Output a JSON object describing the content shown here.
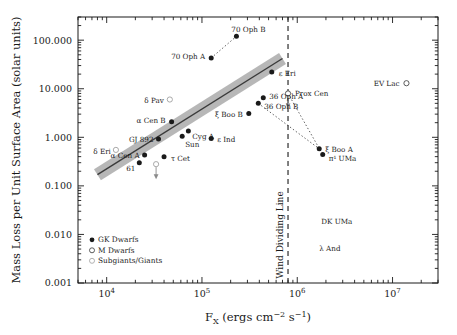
{
  "figure": {
    "title": "",
    "axis": {
      "xlabel_parts": {
        "f": "F",
        "sub_x": "X",
        "rest": " (ergs cm",
        "sup1": "−2",
        "mid": " s",
        "sup2": "−1",
        "close": ")"
      },
      "xlabel_plain": "Fx (ergs cm-2 s-1)",
      "ylabel": "Mass Loss per Unit Surface Area (solar units)",
      "x_ticks": [
        "10⁴",
        "10⁵",
        "10⁶",
        "10⁷"
      ],
      "x_tick_values": [
        10000,
        100000,
        1000000,
        10000000
      ],
      "y_ticks": [
        "100.000",
        "10.000",
        "1.000",
        "0.100",
        "0.010",
        "0.001"
      ],
      "y_tick_values": [
        100,
        10,
        1,
        0.1,
        0.01,
        0.001
      ],
      "xlim": [
        5000,
        30000000
      ],
      "ylim": [
        0.001,
        300
      ],
      "xscale": "log",
      "yscale": "log",
      "grid": false
    },
    "legend": {
      "position": "lower-left-inside",
      "items": [
        {
          "label": "GK Dwarfs",
          "marker": "filled-circle",
          "color": "#1a1a1a"
        },
        {
          "label": "M Dwarfs",
          "marker": "open-circle",
          "color": "#1a1a1a"
        },
        {
          "label": "Subgiants/Giants",
          "marker": "open-circle-light",
          "color": "#9a9a9a"
        }
      ]
    },
    "annotations": [
      {
        "name": "wind-dividing-line",
        "text": "Wind Dividing Line",
        "orientation": "vertical",
        "x_value": 800000,
        "style": "dashed"
      }
    ]
  },
  "chart_data": {
    "type": "scatter",
    "title": "",
    "xlabel": "Fx (ergs cm^-2 s^-1)",
    "ylabel": "Mass Loss per Unit Surface Area (solar units)",
    "xscale": "log",
    "yscale": "log",
    "xlim": [
      5000,
      30000000
    ],
    "ylim": [
      0.001,
      300
    ],
    "xticks": [
      10000,
      100000,
      1000000,
      10000000
    ],
    "yticks": [
      100,
      10,
      1,
      0.1,
      0.01,
      0.001
    ],
    "grid": false,
    "legend": [
      "GK Dwarfs",
      "M Dwarfs",
      "Subgiants/Giants"
    ],
    "fit": {
      "description": "power-law best fit with shaded uncertainty band",
      "x_start": 8000,
      "y_start": 0.17,
      "x_end": 700000,
      "y_end": 42,
      "band_color": "#8a8a8a",
      "line_color": "#3a3a3a"
    },
    "series": [
      {
        "name": "GK Dwarfs",
        "marker": "filled-circle",
        "points": [
          {
            "label": "70 Oph B",
            "x": 230000,
            "y": 120,
            "lx": 12,
            "ly": -6,
            "anchor": "middle"
          },
          {
            "label": "70 Oph A",
            "x": 125000,
            "y": 43,
            "lx": -6,
            "ly": -1,
            "anchor": "end"
          },
          {
            "label": "ε Eri",
            "x": 540000,
            "y": 22,
            "lx": 7,
            "ly": 2,
            "anchor": "start"
          },
          {
            "label": "36 Oph A",
            "x": 440000,
            "y": 6.5,
            "lx": 6,
            "ly": -1,
            "anchor": "start"
          },
          {
            "label": "36 Oph B",
            "x": 390000,
            "y": 5.0,
            "lx": 6,
            "ly": 4,
            "anchor": "start"
          },
          {
            "label": "ξ Boo B",
            "x": 310000,
            "y": 3.1,
            "lx": -6,
            "ly": 2,
            "anchor": "end"
          },
          {
            "label": "α Cen B",
            "x": 48000,
            "y": 2.1,
            "lx": -6,
            "ly": -1,
            "anchor": "end"
          },
          {
            "label": "Cyg A",
            "x": 72000,
            "y": 1.35,
            "lx": 4,
            "ly": 6,
            "anchor": "start"
          },
          {
            "label": "Sun",
            "x": 62000,
            "y": 1.05,
            "lx": 3,
            "ly": 9,
            "anchor": "start"
          },
          {
            "label": "GJ 892",
            "x": 35000,
            "y": 0.92,
            "lx": -5,
            "ly": 1,
            "anchor": "end"
          },
          {
            "label": "ε Ind",
            "x": 125000,
            "y": 0.95,
            "lx": 6,
            "ly": 2,
            "anchor": "start"
          },
          {
            "label": "α Cen A",
            "x": 25000,
            "y": 0.43,
            "lx": -5,
            "ly": 1,
            "anchor": "end"
          },
          {
            "label": "τ Cet",
            "x": 40000,
            "y": 0.4,
            "lx": 7,
            "ly": 2,
            "anchor": "start"
          },
          {
            "label": "61",
            "x": 22000,
            "y": 0.3,
            "lx": -4,
            "ly": 6,
            "anchor": "end"
          },
          {
            "label": "ξ Boo A",
            "x": 1700000,
            "y": 0.58,
            "lx": 6,
            "ly": 1,
            "anchor": "start"
          },
          {
            "label": "π¹ UMa",
            "x": 1850000,
            "y": 0.44,
            "lx": 6,
            "ly": 4,
            "anchor": "start"
          }
        ]
      },
      {
        "name": "M Dwarfs",
        "marker": "open-circle",
        "points": [
          {
            "label": "Prox Cen",
            "x": 800000,
            "y": 8.0,
            "lx": 7,
            "ly": 1,
            "anchor": "start",
            "uplim": true
          },
          {
            "label": "EV Lac",
            "x": 14000000,
            "y": 13.0,
            "lx": -7,
            "ly": 1,
            "anchor": "end"
          }
        ]
      },
      {
        "name": "Subgiants/Giants",
        "marker": "open-circle-light",
        "points": [
          {
            "label": "δ Pav",
            "x": 46000,
            "y": 6.0,
            "lx": -6,
            "ly": 1,
            "anchor": "end"
          },
          {
            "label": "δ Eri",
            "x": 12500,
            "y": 0.55,
            "lx": -5,
            "ly": 2,
            "anchor": "end"
          },
          {
            "label": "",
            "x": 33000,
            "y": 0.28,
            "lx": 0,
            "ly": 0,
            "anchor": "start",
            "uplim": true
          }
        ]
      }
    ],
    "text_only_labels": [
      {
        "label": "DK UMa",
        "x": 2600000,
        "y": 0.0165
      },
      {
        "label": "λ And",
        "x": 2200000,
        "y": 0.0046
      }
    ],
    "connectors": [
      {
        "from": "70 Oph A",
        "to": "70 Oph B",
        "style": "dotted"
      },
      {
        "from": "36 Oph B",
        "to": "ξ Boo A",
        "style": "dotted"
      },
      {
        "from": "Prox Cen",
        "to": "π¹ UMa",
        "style": "dotted"
      }
    ]
  }
}
